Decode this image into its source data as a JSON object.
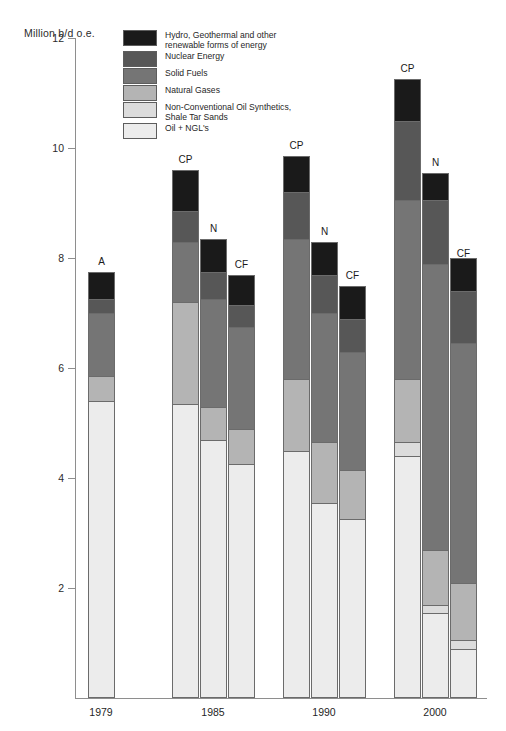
{
  "axis": {
    "unit_label": "Million b/d o.e.",
    "y_ticks": [
      "12",
      "10",
      "8",
      "6",
      "4",
      "2"
    ],
    "x_groups": [
      "1979",
      "1985",
      "1990",
      "2000"
    ]
  },
  "legend": [
    {
      "key": "hydro",
      "label": "Hydro, Geothermal and other\nrenewable forms of energy",
      "color": "#1a1a1a"
    },
    {
      "key": "nuclear",
      "label": "Nuclear Energy",
      "color": "#575757"
    },
    {
      "key": "solid",
      "label": "Solid Fuels",
      "color": "#757575"
    },
    {
      "key": "gas",
      "label": "Natural Gases",
      "color": "#b4b4b4"
    },
    {
      "key": "noncon",
      "label": "Non-Conventional Oil Synthetics,\nShale Tar Sands",
      "color": "#dcdcdc"
    },
    {
      "key": "oil",
      "label": "Oil + NGL's",
      "color": "#ececec"
    }
  ],
  "chart_data": {
    "type": "bar",
    "title": "",
    "subtitle": "",
    "xlabel": "",
    "ylabel": "Million b/d o.e.",
    "ylim": [
      0,
      12
    ],
    "yticks": [
      2,
      4,
      6,
      8,
      10,
      12
    ],
    "grid": false,
    "legend_position": "top-left",
    "stacked": true,
    "categories": [
      "1979",
      "1985",
      "1990",
      "2000"
    ],
    "scenarios": [
      {
        "code": "A",
        "name": "Actual"
      },
      {
        "code": "CP",
        "name": "Current Policies"
      },
      {
        "code": "N",
        "name": "N scenario"
      },
      {
        "code": "CF",
        "name": "CF scenario"
      }
    ],
    "series": [
      {
        "name": "Oil + NGL's",
        "key": "oil"
      },
      {
        "name": "Non-Conventional Oil Synthetics, Shale Tar Sands",
        "key": "noncon"
      },
      {
        "name": "Natural Gases",
        "key": "gas"
      },
      {
        "name": "Solid Fuels",
        "key": "solid"
      },
      {
        "name": "Nuclear Energy",
        "key": "nuclear"
      },
      {
        "name": "Hydro, Geothermal and other renewable forms of energy",
        "key": "hydro"
      }
    ],
    "bars": [
      {
        "group": "1979",
        "scenario": "A",
        "values": {
          "oil": 5.4,
          "noncon": 0.0,
          "gas": 0.45,
          "solid": 1.15,
          "nuclear": 0.25,
          "hydro": 0.5
        },
        "total": 7.75
      },
      {
        "group": "1985",
        "scenario": "CP",
        "values": {
          "oil": 5.35,
          "noncon": 0.0,
          "gas": 1.85,
          "solid": 1.1,
          "nuclear": 0.55,
          "hydro": 0.75
        },
        "total": 9.6
      },
      {
        "group": "1985",
        "scenario": "N",
        "values": {
          "oil": 4.7,
          "noncon": 0.0,
          "gas": 0.6,
          "solid": 1.95,
          "nuclear": 0.5,
          "hydro": 0.6
        },
        "total": 8.35
      },
      {
        "group": "1985",
        "scenario": "CF",
        "values": {
          "oil": 4.25,
          "noncon": 0.0,
          "gas": 0.65,
          "solid": 1.85,
          "nuclear": 0.4,
          "hydro": 0.55
        },
        "total": 7.7
      },
      {
        "group": "1990",
        "scenario": "CP",
        "values": {
          "oil": 4.5,
          "noncon": 0.0,
          "gas": 1.3,
          "solid": 2.55,
          "nuclear": 0.85,
          "hydro": 0.65
        },
        "total": 9.85
      },
      {
        "group": "1990",
        "scenario": "N",
        "values": {
          "oil": 3.55,
          "noncon": 0.0,
          "gas": 1.1,
          "solid": 2.35,
          "nuclear": 0.7,
          "hydro": 0.6
        },
        "total": 8.3
      },
      {
        "group": "1990",
        "scenario": "CF",
        "values": {
          "oil": 3.25,
          "noncon": 0.0,
          "gas": 0.9,
          "solid": 2.15,
          "nuclear": 0.6,
          "hydro": 0.6
        },
        "total": 7.5
      },
      {
        "group": "2000",
        "scenario": "CP",
        "values": {
          "oil": 4.4,
          "noncon": 0.25,
          "gas": 1.15,
          "solid": 3.25,
          "nuclear": 1.45,
          "hydro": 0.75
        },
        "total": 11.25
      },
      {
        "group": "2000",
        "scenario": "N",
        "values": {
          "oil": 1.55,
          "noncon": 0.15,
          "gas": 1.0,
          "solid": 5.2,
          "nuclear": 1.15,
          "hydro": 0.5
        },
        "total": 9.55
      },
      {
        "group": "2000",
        "scenario": "CF",
        "values": {
          "oil": 0.9,
          "noncon": 0.15,
          "gas": 1.05,
          "solid": 4.35,
          "nuclear": 0.95,
          "hydro": 0.6
        },
        "total": 7.9
      }
    ]
  },
  "geometry": {
    "baseline_y": 698,
    "px_per_unit": 55,
    "bar_width": 27,
    "bar_x": [
      88,
      172,
      200,
      228,
      283,
      311,
      339,
      394,
      422,
      450
    ],
    "group_label_x": [
      101,
      213,
      324,
      435
    ]
  }
}
